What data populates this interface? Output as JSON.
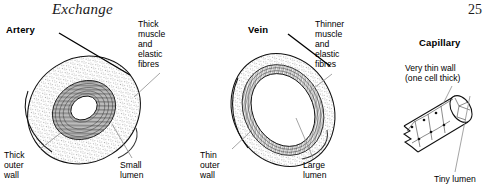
{
  "page": {
    "running_head": "Exchange",
    "folio": "25"
  },
  "figure": {
    "vessels": [
      {
        "id": "artery",
        "heading": "Artery",
        "labels": {
          "muscle": "Thick\nmuscle\nand\nelastic\nfibres",
          "outer_wall": "Thick\nouter\nwall",
          "lumen": "Small\nlumen"
        }
      },
      {
        "id": "vein",
        "heading": "Vein",
        "labels": {
          "muscle": "Thinner\nmuscle\nand\nelastic\nfibres",
          "outer_wall": "Thin\nouter\nwall",
          "lumen": "Large\nlumen"
        }
      },
      {
        "id": "capillary",
        "heading": "Capillary",
        "labels": {
          "wall": "Very thin wall\n(one cell thick)",
          "lumen": "Tiny lumen"
        }
      }
    ]
  },
  "colors": {
    "ink": "#000000",
    "leader_line": "#8d8d8d",
    "outline": "#111111",
    "paper": "#ffffff"
  }
}
